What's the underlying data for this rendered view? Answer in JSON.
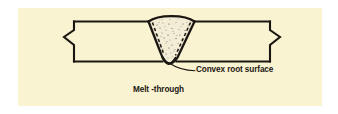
{
  "figure": {
    "name": "melt-through-weld-cross-section",
    "background_color": "#faf3d2",
    "page_color": "#ffffff",
    "line_color": "#1a1712",
    "bead_fill_color": "#f2ead0",
    "text_color": "#1a1712",
    "labels": {
      "convex_root_surface": "Convex root surface",
      "melt_through": "Melt -through"
    },
    "parts": {
      "base_plate": "base-metal-plate",
      "left_break": "break-symbol-left",
      "right_break": "break-symbol-right",
      "weld_bead": "weld-bead-cross-section",
      "bead_crown": "convex-weld-face",
      "bead_root": "convex-root-protrusion",
      "fusion_line_left": "dashed-fusion-line-left",
      "fusion_line_right": "dashed-fusion-line-right",
      "leader": "leader-line-to-root"
    }
  }
}
